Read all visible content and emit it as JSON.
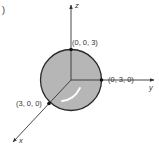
{
  "figure": {
    "panel_label": ")",
    "colors": {
      "sphere_fill": "#b6b6b6",
      "sphere_outline": "#2a2a2a",
      "axis": "#333333",
      "highlight": "#ffffff",
      "text": "#333333"
    },
    "axes": {
      "z": {
        "label": "z"
      },
      "y": {
        "label": "y"
      },
      "x": {
        "label": "x"
      }
    },
    "points": [
      {
        "label": "(0, 0, 3)",
        "axis": "z"
      },
      {
        "label": "(0, 3, 0)",
        "axis": "y"
      },
      {
        "label": "(3, 0, 0)",
        "axis": "x"
      }
    ],
    "sphere": {
      "radius": 3,
      "center": "origin"
    }
  }
}
